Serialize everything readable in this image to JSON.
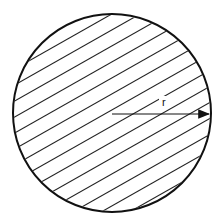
{
  "diagram": {
    "shape": "circle",
    "fill": "diagonal-hatching",
    "stroke_color": "#111111",
    "center": [
      112,
      113
    ],
    "radius_px": 99,
    "radius_label": "r",
    "arrow": {
      "from": "center",
      "to": "right-edge",
      "direction": "horizontal"
    }
  }
}
